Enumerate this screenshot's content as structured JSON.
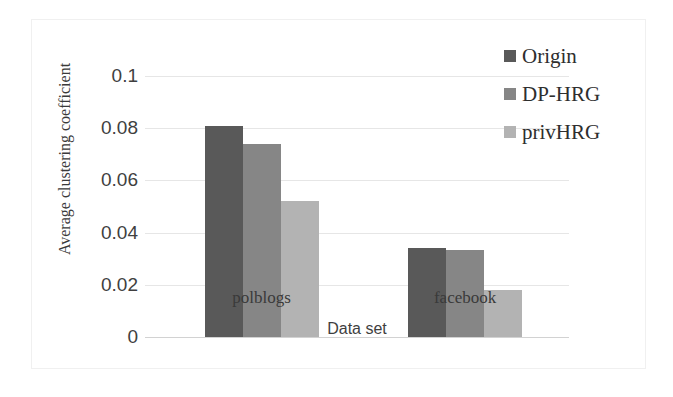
{
  "chart_data": {
    "type": "bar",
    "title": "",
    "categories": [
      "polblogs",
      "facebook"
    ],
    "series": [
      {
        "name": "Origin",
        "color": "#595959",
        "values": [
          0.081,
          0.034
        ]
      },
      {
        "name": "DP-HRG",
        "color": "#868686",
        "values": [
          0.074,
          0.0335
        ]
      },
      {
        "name": "privHRG",
        "color": "#b3b3b3",
        "values": [
          0.052,
          0.018
        ]
      }
    ],
    "xlabel": "Data set",
    "ylabel": "Average clustering coefficient",
    "ylim": [
      0,
      0.1
    ],
    "ytick_labels": [
      "0",
      "0.02",
      "0.04",
      "0.06",
      "0.08",
      "0.1"
    ],
    "ytick_values": [
      0,
      0.02,
      0.04,
      0.06,
      0.08,
      0.1
    ],
    "grid": true,
    "legend_position": "top-right"
  },
  "axis": {
    "y_title": "Average clustering coefficient",
    "x_title": "Data set"
  },
  "legend": {
    "entries": [
      {
        "label": "Origin"
      },
      {
        "label": "DP-HRG"
      },
      {
        "label": "privHRG"
      }
    ]
  }
}
